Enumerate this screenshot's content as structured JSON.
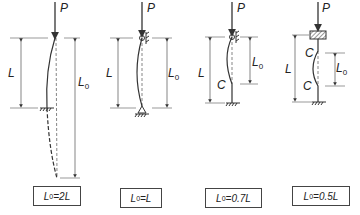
{
  "panels": [
    {
      "id": "fixed-free",
      "load": "P",
      "length_label": "L",
      "effective_label": "L",
      "effective_sub": "0",
      "formula": {
        "lhs": "L",
        "sub": "0",
        "rhs": "=2L"
      }
    },
    {
      "id": "pinned-pinned",
      "load": "P",
      "length_label": "L",
      "effective_label": "L",
      "effective_sub": "0",
      "formula": {
        "lhs": "L",
        "sub": "0",
        "rhs": "=L"
      }
    },
    {
      "id": "fixed-pinned",
      "load": "P",
      "length_label": "L",
      "effective_label": "L",
      "effective_sub": "0",
      "inflection": "C",
      "formula": {
        "lhs": "L",
        "sub": "0",
        "rhs": "=0.7L"
      }
    },
    {
      "id": "fixed-fixed",
      "load": "P",
      "length_label": "L",
      "effective_label": "L",
      "effective_sub": "0",
      "inflection_top": "C",
      "inflection_bottom": "C",
      "formula": {
        "lhs": "L",
        "sub": "0",
        "rhs": "=0.5L"
      }
    }
  ]
}
